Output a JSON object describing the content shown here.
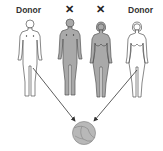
{
  "labels": {
    "left": "Donor",
    "right": "Donor",
    "excluded_mark_1": "✕",
    "excluded_mark_2": "✕"
  },
  "figures": [
    {
      "id": "donor-man",
      "sex": "male",
      "fill": "#ffffff",
      "role": "Donor"
    },
    {
      "id": "parent-man",
      "sex": "male",
      "fill": "#a9a9a9",
      "role": "excluded"
    },
    {
      "id": "parent-woman",
      "sex": "female",
      "fill": "#a9a9a9",
      "role": "excluded"
    },
    {
      "id": "donor-woman",
      "sex": "female",
      "fill": "#ffffff",
      "role": "Donor"
    }
  ],
  "embryo": {
    "cells": 4,
    "fill": "#b8b8b8"
  },
  "colors": {
    "outline": "#555555",
    "arrow": "#333333",
    "text": "#333333"
  }
}
